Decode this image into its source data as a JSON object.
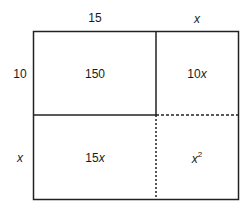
{
  "diagram": {
    "top_labels": {
      "left": "15",
      "right": "x"
    },
    "side_labels": {
      "top": "10",
      "bottom": "x"
    },
    "cells": {
      "top_left": "150",
      "top_right_coef": "10",
      "top_right_var": "x",
      "bottom_left_coef": "15",
      "bottom_left_var": "x",
      "bottom_right_var": "x",
      "bottom_right_exp": "2"
    },
    "colors": {
      "line": "#222222",
      "text": "#1a1a1a",
      "background": "#ffffff"
    }
  }
}
